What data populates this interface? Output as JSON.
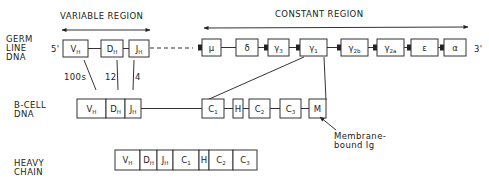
{
  "regions": {
    "variable": "VARIABLE REGION",
    "constant": "CONSTANT REGION"
  },
  "rows": {
    "germline": [
      "GERM",
      "LINE",
      "DNA"
    ],
    "bcell": [
      "B-CELL",
      "DNA"
    ],
    "heavy": [
      "HEAVY",
      "CHAIN"
    ]
  },
  "ends": {
    "five": "5'",
    "three": "3'"
  },
  "germline_variable": [
    {
      "main": "V",
      "sub": "H"
    },
    {
      "main": "D",
      "sub": "H"
    },
    {
      "main": "J",
      "sub": "H"
    }
  ],
  "germline_constant": [
    {
      "main": "μ",
      "sub": ""
    },
    {
      "main": "δ",
      "sub": ""
    },
    {
      "main": "γ",
      "sub": "3"
    },
    {
      "main": "γ",
      "sub": "1"
    },
    {
      "main": "γ",
      "sub": "2b"
    },
    {
      "main": "γ",
      "sub": "2a"
    },
    {
      "main": "ε",
      "sub": ""
    },
    {
      "main": "α",
      "sub": ""
    }
  ],
  "segment_counts": [
    "100s",
    "12",
    "4"
  ],
  "bcell_vdj": [
    {
      "main": "V",
      "sub": "H"
    },
    {
      "main": "D",
      "sub": "H"
    },
    {
      "main": "J",
      "sub": "H"
    }
  ],
  "bcell_constant": [
    {
      "main": "C",
      "sub": "1"
    },
    {
      "main": "H",
      "sub": ""
    },
    {
      "main": "C",
      "sub": "2"
    },
    {
      "main": "C",
      "sub": "3"
    },
    {
      "main": "M",
      "sub": ""
    }
  ],
  "membrane_label": [
    "Membrane-",
    "bound Ig"
  ],
  "heavy_chain": [
    {
      "main": "V",
      "sub": "H"
    },
    {
      "main": "D",
      "sub": "H"
    },
    {
      "main": "J",
      "sub": "H"
    },
    {
      "main": "C",
      "sub": "1"
    },
    {
      "main": "H",
      "sub": ""
    },
    {
      "main": "C",
      "sub": "2"
    },
    {
      "main": "C",
      "sub": "3"
    }
  ]
}
